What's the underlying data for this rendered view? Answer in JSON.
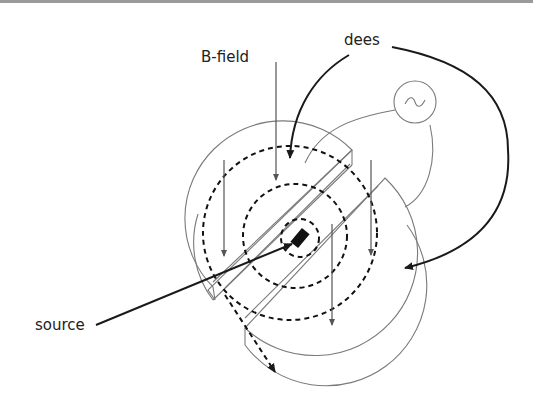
{
  "diagram": {
    "labels": {
      "dees": "dees",
      "b_field": "B-field",
      "source": "source"
    },
    "ac_source_symbol": "~",
    "colors": {
      "background": "#ffffff",
      "outline": "#7a7a7a",
      "path": "#111111",
      "leader": "#1a1a1a",
      "top_border": "#9a9a9a"
    }
  }
}
